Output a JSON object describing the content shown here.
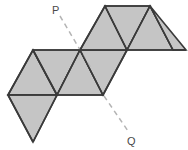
{
  "figure": {
    "fill_color": "#c5c5c5",
    "stroke_color": "#3a3a3a",
    "axis_color": "#b4b4b4",
    "background": "#ffffff",
    "labels": {
      "p": "P",
      "q": "Q"
    },
    "axis": {
      "start": {
        "x": 60,
        "y": 16
      },
      "end": {
        "x": 128,
        "y": 131
      }
    },
    "label_positions": {
      "p": {
        "x": 52,
        "y": 14
      },
      "q": {
        "x": 127,
        "y": 145
      }
    },
    "faces": [
      {
        "name": "left-upper-left-triangle",
        "points": "8,95 33,50 57,95"
      },
      {
        "name": "left-upper-right-triangle",
        "points": "33,50 57,95 80,50"
      },
      {
        "name": "left-lower-triangle",
        "points": "8,95 57,95 33,142"
      },
      {
        "name": "mid-left-triangle",
        "points": "57,95 80,50 103,95"
      },
      {
        "name": "mid-right-triangle",
        "points": "80,50 103,95 127,50"
      },
      {
        "name": "top-left-triangle",
        "points": "80,50 105,6 127,50"
      },
      {
        "name": "top-mid-triangle",
        "points": "105,6 127,50 150,6"
      },
      {
        "name": "top-right-triangle",
        "points": "127,50 150,6 173,50"
      },
      {
        "name": "top-far-right-triangle",
        "points": "150,6 173,50 186,50"
      }
    ],
    "fold_lines": [
      {
        "name": "fold-left-band-top",
        "d": "M 33,50 L 80,50"
      },
      {
        "name": "fold-left-band-bottom",
        "d": "M 8,95 L 103,95"
      },
      {
        "name": "fold-top-band-top",
        "d": "M 105,6 L 150,6"
      },
      {
        "name": "fold-mid-band-top",
        "d": "M 80,50 L 186,50"
      },
      {
        "name": "fold-diag-a",
        "d": "M 8,95 L 33,50"
      },
      {
        "name": "fold-diag-b",
        "d": "M 33,50 L 57,95"
      },
      {
        "name": "fold-diag-c",
        "d": "M 57,95 L 80,50"
      },
      {
        "name": "fold-diag-d",
        "d": "M 80,50 L 103,95"
      },
      {
        "name": "fold-diag-e",
        "d": "M 103,95 L 127,50"
      },
      {
        "name": "fold-diag-f",
        "d": "M 8,95 L 33,142"
      },
      {
        "name": "fold-diag-g",
        "d": "M 57,95 L 33,142"
      },
      {
        "name": "fold-diag-h",
        "d": "M 80,50 L 105,6"
      },
      {
        "name": "fold-diag-i",
        "d": "M 105,6 L 127,50"
      },
      {
        "name": "fold-diag-j",
        "d": "M 127,50 L 150,6"
      },
      {
        "name": "fold-diag-k",
        "d": "M 150,6 L 173,50"
      },
      {
        "name": "fold-diag-l",
        "d": "M 173,50 L 186,50"
      }
    ]
  }
}
